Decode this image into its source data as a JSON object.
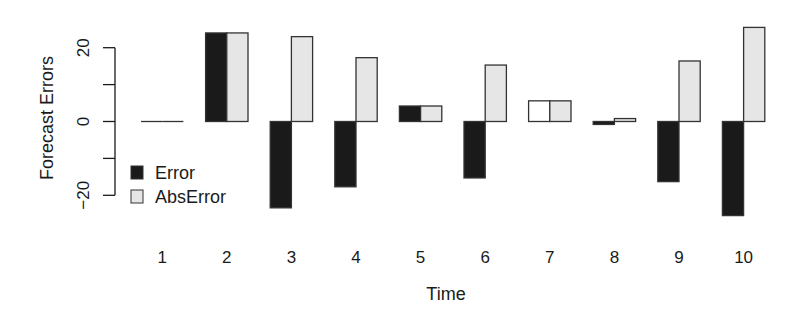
{
  "chart_data": {
    "type": "bar",
    "title": "",
    "xlabel": "Time",
    "ylabel": "Forecast Errors",
    "categories": [
      "1",
      "2",
      "3",
      "4",
      "5",
      "6",
      "7",
      "8",
      "9",
      "10"
    ],
    "series": [
      {
        "name": "Error",
        "color": "#1a1a1a",
        "values": [
          0,
          24,
          -23.4,
          -17.7,
          4.2,
          -15.3,
          5.6,
          -0.8,
          -16.3,
          -25.5
        ]
      },
      {
        "name": "AbsError",
        "color": "#e6e6e6",
        "values": [
          0,
          24,
          23.0,
          17.3,
          4.2,
          15.3,
          5.6,
          0.8,
          16.4,
          25.5
        ]
      }
    ],
    "bar_fill_overrides": [
      {
        "series": "Error",
        "category": "7",
        "color": "#ffffff"
      }
    ],
    "ylim": [
      -27,
      27
    ],
    "yticks": [
      20,
      10,
      0,
      -10,
      -20
    ],
    "ytick_labels": [
      "20",
      "",
      "0",
      "",
      "-20"
    ],
    "grid": false,
    "legend": {
      "position": "left-lower-inside",
      "entries": [
        "Error",
        "AbsError"
      ]
    },
    "outline_color": "#333333"
  }
}
